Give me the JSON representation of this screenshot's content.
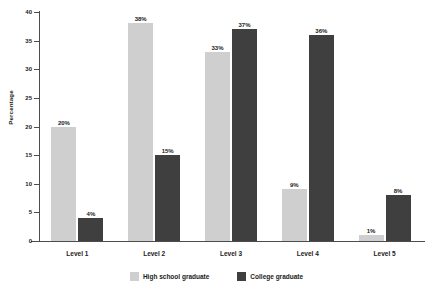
{
  "chart_data": {
    "type": "bar",
    "title": "",
    "xlabel": "",
    "ylabel": "Percentage",
    "ylim": [
      0,
      40
    ],
    "yticks": [
      0,
      5,
      10,
      15,
      20,
      25,
      30,
      35,
      40
    ],
    "ytick_labels": [
      "0",
      "5",
      "10",
      "15",
      "20",
      "25",
      "30",
      "35",
      "40"
    ],
    "grid": false,
    "legend_position": "bottom-center",
    "value_label_suffix": "%",
    "categories": [
      "Level 1",
      "Level 2",
      "Level 3",
      "Level 4",
      "Level 5"
    ],
    "series": [
      {
        "name": "High school graduate",
        "color": "#cfcfcf",
        "values": [
          20,
          38,
          33,
          9,
          1
        ],
        "labels": [
          "20%",
          "38%",
          "33%",
          "9%",
          "1%"
        ]
      },
      {
        "name": "College graduate",
        "color": "#3f3f3f",
        "values": [
          4,
          15,
          37,
          36,
          8
        ],
        "labels": [
          "4%",
          "15%",
          "37%",
          "36%",
          "8%"
        ]
      }
    ]
  },
  "legend": {
    "items": [
      {
        "label": "High school graduate",
        "swatch": "light"
      },
      {
        "label": "College graduate",
        "swatch": "dark"
      }
    ]
  }
}
